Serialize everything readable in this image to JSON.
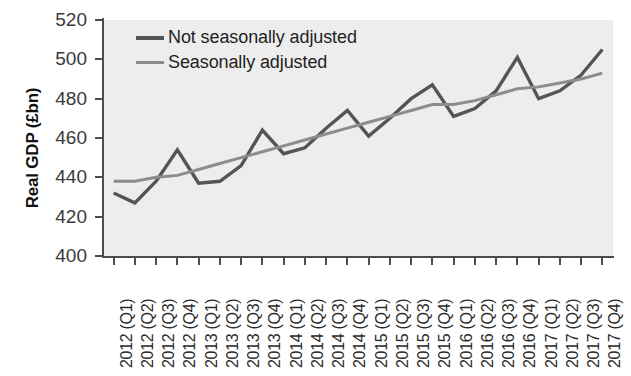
{
  "chart_data": {
    "type": "line",
    "title": "",
    "xlabel": "",
    "ylabel": "Real GDP (£bn)",
    "ylim": [
      400,
      520
    ],
    "yticks": [
      400,
      420,
      440,
      460,
      480,
      500,
      520
    ],
    "grid": false,
    "legend_position": "top-left",
    "categories": [
      "2012 (Q1)",
      "2012 (Q2)",
      "2012 (Q3)",
      "2012 (Q4)",
      "2013 (Q1)",
      "2013 (Q2)",
      "2013 (Q3)",
      "2013 (Q4)",
      "2014 (Q1)",
      "2014 (Q2)",
      "2014 (Q3)",
      "2014 (Q4)",
      "2015 (Q1)",
      "2015 (Q2)",
      "2015 (Q3)",
      "2015 (Q4)",
      "2016 (Q1)",
      "2016 (Q2)",
      "2016 (Q3)",
      "2016 (Q4)",
      "2017 (Q1)",
      "2017 (Q2)",
      "2017 (Q3)",
      "2017 (Q4)"
    ],
    "series": [
      {
        "name": "Not seasonally adjusted",
        "color": "#555555",
        "values": [
          432,
          427,
          438,
          454,
          437,
          438,
          446,
          464,
          452,
          455,
          465,
          474,
          461,
          470,
          480,
          487,
          471,
          475,
          484,
          501,
          480,
          484,
          492,
          505
        ]
      },
      {
        "name": "Seasonally adjusted",
        "color": "#8c8c8c",
        "values": [
          438,
          438,
          440,
          441,
          444,
          447,
          450,
          453,
          456,
          459,
          462,
          465,
          468,
          471,
          474,
          477,
          477,
          479,
          482,
          485,
          486,
          488,
          490,
          493
        ]
      }
    ]
  },
  "legend": {
    "items": [
      {
        "label": "Not seasonally adjusted",
        "color": "#555555"
      },
      {
        "label": "Seasonally adjusted",
        "color": "#8c8c8c"
      }
    ]
  },
  "axes": {
    "y_title": "Real GDP (£bn)"
  }
}
